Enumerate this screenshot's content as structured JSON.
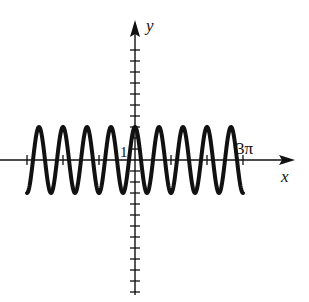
{
  "chart_data": {
    "type": "line",
    "title": "",
    "function": "y = 3cos(3x)",
    "xlabel": "x",
    "ylabel": "y",
    "x_tick_label": "3π",
    "y_tick_label": "1",
    "xlim": [
      "-3π",
      "3π"
    ],
    "ylim": [
      -13,
      10
    ],
    "amplitude": 3,
    "period": "2π/3",
    "grid": false,
    "series": [
      {
        "name": "curve",
        "color": "#111111"
      }
    ]
  },
  "labels": {
    "x_axis": "x",
    "y_axis": "y",
    "x_tick": "3π",
    "y_tick": "1"
  }
}
